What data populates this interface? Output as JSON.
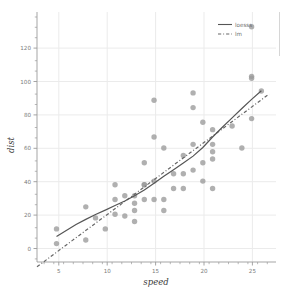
{
  "chart_data": {
    "type": "scatter",
    "title": "",
    "xlabel": "speed",
    "ylabel": "dist",
    "xlim": [
      2,
      26.5
    ],
    "ylim": [
      -8,
      128
    ],
    "xticks": [
      5,
      10,
      15,
      20,
      25
    ],
    "yticks": [
      0,
      20,
      40,
      60,
      80,
      100,
      120
    ],
    "grid": true,
    "legend_position": "top-right",
    "point_color": "#9a9a9a",
    "loess_color": "#555555",
    "lm_color": "#666666",
    "grid_color": "#ebebeb",
    "axis_color": "#9b9b9b",
    "background": "#ffffff",
    "legend": [
      {
        "label": "loesss",
        "style": "solid"
      },
      {
        "label": "lm",
        "style": "dashed"
      }
    ],
    "x": [
      4,
      4,
      7,
      7,
      8,
      9,
      10,
      10,
      10,
      11,
      11,
      12,
      12,
      12,
      12,
      13,
      13,
      13,
      13,
      14,
      14,
      14,
      14,
      15,
      15,
      15,
      16,
      16,
      17,
      17,
      17,
      18,
      18,
      18,
      18,
      19,
      19,
      19,
      20,
      20,
      20,
      20,
      20,
      22,
      23,
      24,
      24,
      24,
      24,
      25
    ],
    "y": [
      2,
      10,
      4,
      22,
      16,
      10,
      18,
      26,
      34,
      17,
      28,
      14,
      20,
      24,
      28,
      26,
      34,
      34,
      46,
      26,
      36,
      60,
      80,
      20,
      26,
      54,
      32,
      40,
      32,
      40,
      50,
      42,
      56,
      76,
      84,
      36,
      46,
      68,
      32,
      48,
      52,
      56,
      64,
      66,
      54,
      70,
      92,
      93,
      120,
      85
    ],
    "series": [
      {
        "name": "loesss",
        "style": "solid",
        "x": [
          4,
          5,
          6,
          7,
          8,
          9,
          10,
          11,
          12,
          13,
          14,
          15,
          16,
          17,
          18,
          19,
          20,
          21,
          22,
          23,
          24,
          25
        ],
        "y": [
          5.9,
          9.1,
          12.4,
          15.2,
          17.8,
          20.2,
          22.7,
          25.2,
          28.0,
          31.2,
          34.8,
          38.6,
          42.2,
          45.8,
          49.6,
          54.3,
          60.0,
          65.3,
          70.4,
          75.5,
          80.5,
          85.2
        ]
      },
      {
        "name": "lm",
        "style": "dashed",
        "x": [
          2,
          25.8
        ],
        "y": [
          -10.6,
          83.4
        ]
      }
    ]
  },
  "caption": {
    "text": ""
  }
}
